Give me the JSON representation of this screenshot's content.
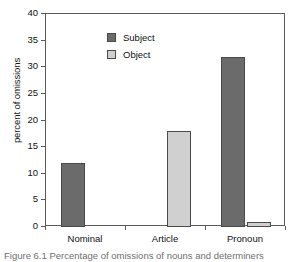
{
  "chart_data": {
    "type": "bar",
    "title": "",
    "subtitle": "",
    "xlabel": "",
    "ylabel": "percent of omissions",
    "categories": [
      "Nominal",
      "Article",
      "Pronoun"
    ],
    "series": [
      {
        "name": "Subject",
        "color": "#6b6b6b",
        "values": [
          12,
          0,
          32
        ]
      },
      {
        "name": "Object",
        "color": "#d0d0d0",
        "values": [
          0,
          18,
          1
        ]
      }
    ],
    "ylim": [
      0,
      40
    ],
    "yticks": [
      0,
      5,
      10,
      15,
      20,
      25,
      30,
      35,
      40
    ],
    "ytick_labels": [
      "0",
      "5",
      "10",
      "15",
      "20",
      "25",
      "30",
      "35",
      "40"
    ],
    "grid": false,
    "legend_position": "top-left",
    "legend_entries": [
      "Subject",
      "Object"
    ]
  },
  "caption": {
    "text": "Figure 6.1  Percentage of omissions of nouns and determiners"
  },
  "axis": {
    "y_title": "percent of omissions"
  }
}
